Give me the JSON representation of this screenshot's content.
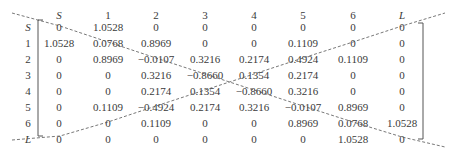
{
  "matrix": {
    "col_labels": [
      "S",
      "1",
      "2",
      "3",
      "4",
      "5",
      "6",
      "L"
    ],
    "row_labels": [
      "S",
      "1",
      "2",
      "3",
      "4",
      "5",
      "6",
      "L"
    ],
    "rows": [
      [
        "0",
        "1.0528",
        "0",
        "0",
        "0",
        "0",
        "0",
        "0"
      ],
      [
        "1.0528",
        "0.0768",
        "0.8969",
        "0",
        "0",
        "0.1109",
        "0",
        "0"
      ],
      [
        "0",
        "0.8969",
        "−0.0107",
        "0.3216",
        "0.2174",
        "0.4924",
        "0.1109",
        "0"
      ],
      [
        "0",
        "0",
        "0.3216",
        "−0.8660",
        "0.1354",
        "0.2174",
        "0",
        "0"
      ],
      [
        "0",
        "0",
        "0.2174",
        "0.1354",
        "−0.8660",
        "0.3216",
        "0",
        "0"
      ],
      [
        "0",
        "0.1109",
        "−0.4924",
        "0.2174",
        "0.3216",
        "−0.0107",
        "0.8969",
        "0"
      ],
      [
        "0",
        "0",
        "0.1109",
        "0",
        "0",
        "0.8969",
        "0.0768",
        "1.0528"
      ],
      [
        "0",
        "0",
        "0",
        "0",
        "0",
        "0",
        "1.0528",
        "0"
      ]
    ]
  },
  "colors": {
    "text": "#3a3a3a",
    "lines": "#555555"
  }
}
